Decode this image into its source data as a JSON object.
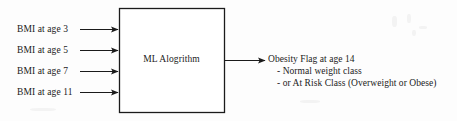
{
  "figure": {
    "background_color": "#fdfdfd",
    "stroke_color": "#1b1b1b",
    "inputs": [
      {
        "label": "BMI at age 3"
      },
      {
        "label": "BMI at age 5"
      },
      {
        "label": "BMI at age 7"
      },
      {
        "label": "BMI at age 11"
      }
    ],
    "process": {
      "label": "ML Alogrithm"
    },
    "output": {
      "lines": [
        "Obesity Flag at age 14",
        "- Normal weight class",
        "- or At Risk Class (Overweight or Obese)"
      ]
    },
    "arrows": {
      "input_arrow_name": "input-arrow",
      "output_arrow_name": "output-arrow"
    }
  }
}
